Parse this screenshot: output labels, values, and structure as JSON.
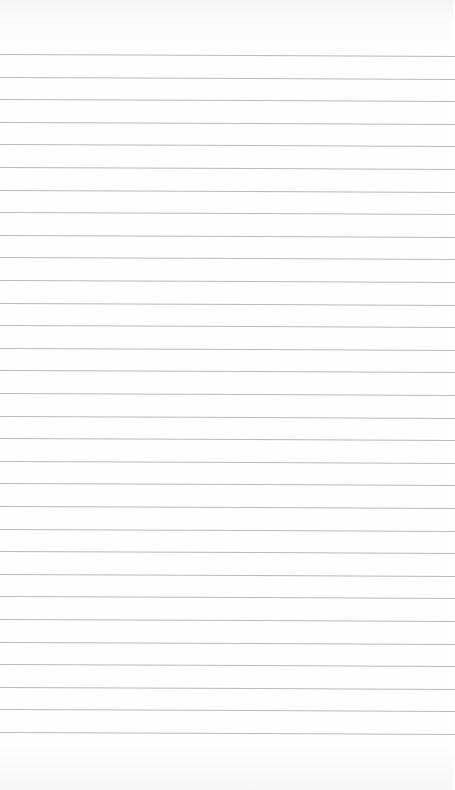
{
  "page": {
    "type": "lined-paper",
    "background_color": "#fdfdfd",
    "rule_color": "#b9b9b9",
    "first_rule_y": 54,
    "rule_spacing": 22.6,
    "rule_count": 31
  }
}
